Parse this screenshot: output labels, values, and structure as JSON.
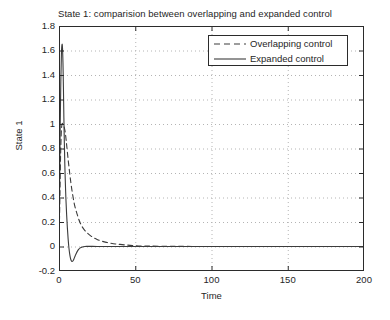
{
  "chart_data": {
    "type": "line",
    "title": "State 1: comparision between overlapping and expanded control",
    "xlabel": "Time",
    "ylabel": "State 1",
    "xlim": [
      0,
      200
    ],
    "ylim": [
      -0.2,
      1.8
    ],
    "xticks": [
      "0",
      "50",
      "100",
      "150",
      "200"
    ],
    "xtick_values": [
      0,
      50,
      100,
      150,
      200
    ],
    "yticks": [
      "-0.2",
      "0",
      "0.2",
      "0.4",
      "0.6",
      "0.8",
      "1",
      "1.2",
      "1.4",
      "1.6",
      "1.8"
    ],
    "ytick_values": [
      -0.2,
      0,
      0.2,
      0.4,
      0.6,
      0.8,
      1,
      1.2,
      1.4,
      1.6,
      1.8
    ],
    "grid": true,
    "grid_style": "dotted",
    "grid_color": "#b4b4b4",
    "legend_position": "top-right",
    "axis_color": "#2b2b2b",
    "background": "#ffffff",
    "series": [
      {
        "name": "Overlapping control",
        "style": "dashed",
        "color": "#3c3c3c",
        "x": [
          0,
          0.5,
          1,
          1.5,
          2,
          2.5,
          3,
          3.5,
          4,
          4.5,
          5,
          6,
          7,
          8,
          9,
          10,
          11,
          12,
          13,
          14,
          15,
          17,
          19,
          21,
          23,
          25,
          28,
          31,
          34,
          37,
          40,
          45,
          50,
          55,
          60,
          70,
          80,
          100,
          120,
          150,
          175,
          200
        ],
        "y": [
          0,
          0.35,
          0.72,
          0.93,
          1.0,
          1.0,
          0.99,
          0.97,
          0.94,
          0.89,
          0.83,
          0.71,
          0.6,
          0.5,
          0.42,
          0.35,
          0.3,
          0.26,
          0.22,
          0.19,
          0.165,
          0.13,
          0.105,
          0.085,
          0.07,
          0.058,
          0.044,
          0.034,
          0.027,
          0.021,
          0.017,
          0.011,
          0.007,
          0.004,
          0.003,
          0.0015,
          0.0008,
          0.0002,
          0.0001,
          0,
          0,
          0
        ]
      },
      {
        "name": "Expanded control",
        "style": "solid",
        "color": "#3c3c3c",
        "x": [
          0,
          0.4,
          0.8,
          1.2,
          1.6,
          2.0,
          2.3,
          2.6,
          2.9,
          3.2,
          3.5,
          3.8,
          4.1,
          4.5,
          5.0,
          5.5,
          6.0,
          6.5,
          7.0,
          7.5,
          8.0,
          8.5,
          9.0,
          9.5,
          10.0,
          10.5,
          11,
          12,
          13,
          14,
          15,
          16,
          17,
          18,
          20,
          22,
          25,
          30,
          40,
          60,
          100,
          150,
          200
        ],
        "y": [
          0,
          0.5,
          1.0,
          1.35,
          1.58,
          1.65,
          1.62,
          1.5,
          1.3,
          1.05,
          0.85,
          0.68,
          0.55,
          0.4,
          0.26,
          0.15,
          0.06,
          -0.01,
          -0.06,
          -0.095,
          -0.115,
          -0.122,
          -0.12,
          -0.11,
          -0.095,
          -0.08,
          -0.065,
          -0.04,
          -0.022,
          -0.011,
          -0.005,
          -0.002,
          0,
          0.001,
          0.001,
          0.001,
          0.0005,
          0,
          0,
          0,
          0,
          0,
          0
        ]
      }
    ]
  }
}
